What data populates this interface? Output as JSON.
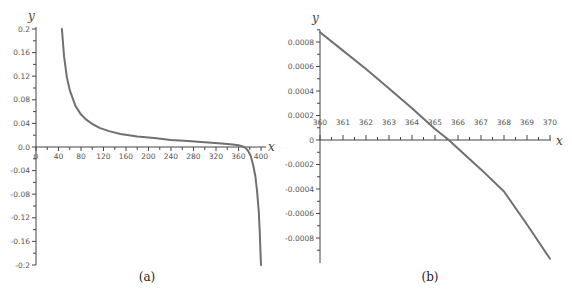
{
  "chart_data": [
    {
      "type": "line",
      "caption": "(a)",
      "xlabel": "x",
      "ylabel": "y",
      "xlim": [
        0,
        400
      ],
      "ylim": [
        -0.2,
        0.2
      ],
      "x_ticks": [
        0,
        40,
        80,
        120,
        160,
        200,
        240,
        280,
        320,
        360,
        400
      ],
      "x_tick_labels": [
        "0",
        "40",
        "80",
        "120",
        "160",
        "200",
        "240",
        "280",
        "320",
        "360",
        "400"
      ],
      "y_ticks": [
        0.2,
        0.16,
        0.12,
        0.08,
        0.04,
        0.0,
        -0.04,
        -0.08,
        -0.12,
        -0.16,
        -0.2
      ],
      "y_tick_labels": [
        "0.2",
        "0.16",
        "0.12",
        "0.08",
        "0.04",
        "0.0",
        "-0.04",
        "-0.08",
        "-0.12",
        "-0.16",
        "-0.2"
      ],
      "grid": false,
      "series": [
        {
          "name": "y(x)",
          "x": [
            46,
            50,
            55,
            60,
            70,
            80,
            90,
            100,
            114,
            130,
            150,
            180,
            210,
            240,
            270,
            300,
            330,
            350,
            360,
            366,
            370,
            374,
            378,
            382,
            386,
            390,
            393,
            396,
            398,
            399,
            400
          ],
          "y": [
            0.2,
            0.153,
            0.118,
            0.096,
            0.07,
            0.055,
            0.046,
            0.039,
            0.032,
            0.027,
            0.022,
            0.018,
            0.015,
            0.012,
            0.01,
            0.008,
            0.006,
            0.004,
            0.003,
            0.0015,
            0.0,
            -0.003,
            -0.008,
            -0.016,
            -0.03,
            -0.05,
            -0.075,
            -0.11,
            -0.15,
            -0.175,
            -0.2
          ]
        }
      ]
    },
    {
      "type": "line",
      "caption": "(b)",
      "xlabel": "x",
      "ylabel": "y",
      "xlim": [
        360,
        370
      ],
      "ylim": [
        -0.001,
        0.0009
      ],
      "x_ticks": [
        360,
        361,
        362,
        363,
        364,
        365,
        366,
        367,
        368,
        369,
        370
      ],
      "x_tick_labels": [
        "360",
        "361",
        "362",
        "363",
        "364",
        "365",
        "366",
        "367",
        "368",
        "369",
        "370"
      ],
      "y_ticks": [
        0.0008,
        0.0006,
        0.0004,
        0.0002,
        0,
        -0.0002,
        -0.0004,
        -0.0006,
        -0.0008
      ],
      "y_tick_labels": [
        "0.0008",
        "0.0006",
        "0.0004",
        "0.0002",
        "0",
        "-0.0002",
        "-0.0004",
        "-0.0006",
        "-0.0008"
      ],
      "grid": false,
      "series": [
        {
          "name": "y(x)",
          "x": [
            360,
            361,
            362,
            363,
            364,
            365,
            365.6,
            366,
            367,
            368,
            369,
            370
          ],
          "y": [
            0.00088,
            0.00073,
            0.00058,
            0.00042,
            0.00026,
            9e-05,
            0.0,
            -7e-05,
            -0.00024,
            -0.00042,
            -0.00069,
            -0.00097
          ]
        }
      ]
    }
  ]
}
